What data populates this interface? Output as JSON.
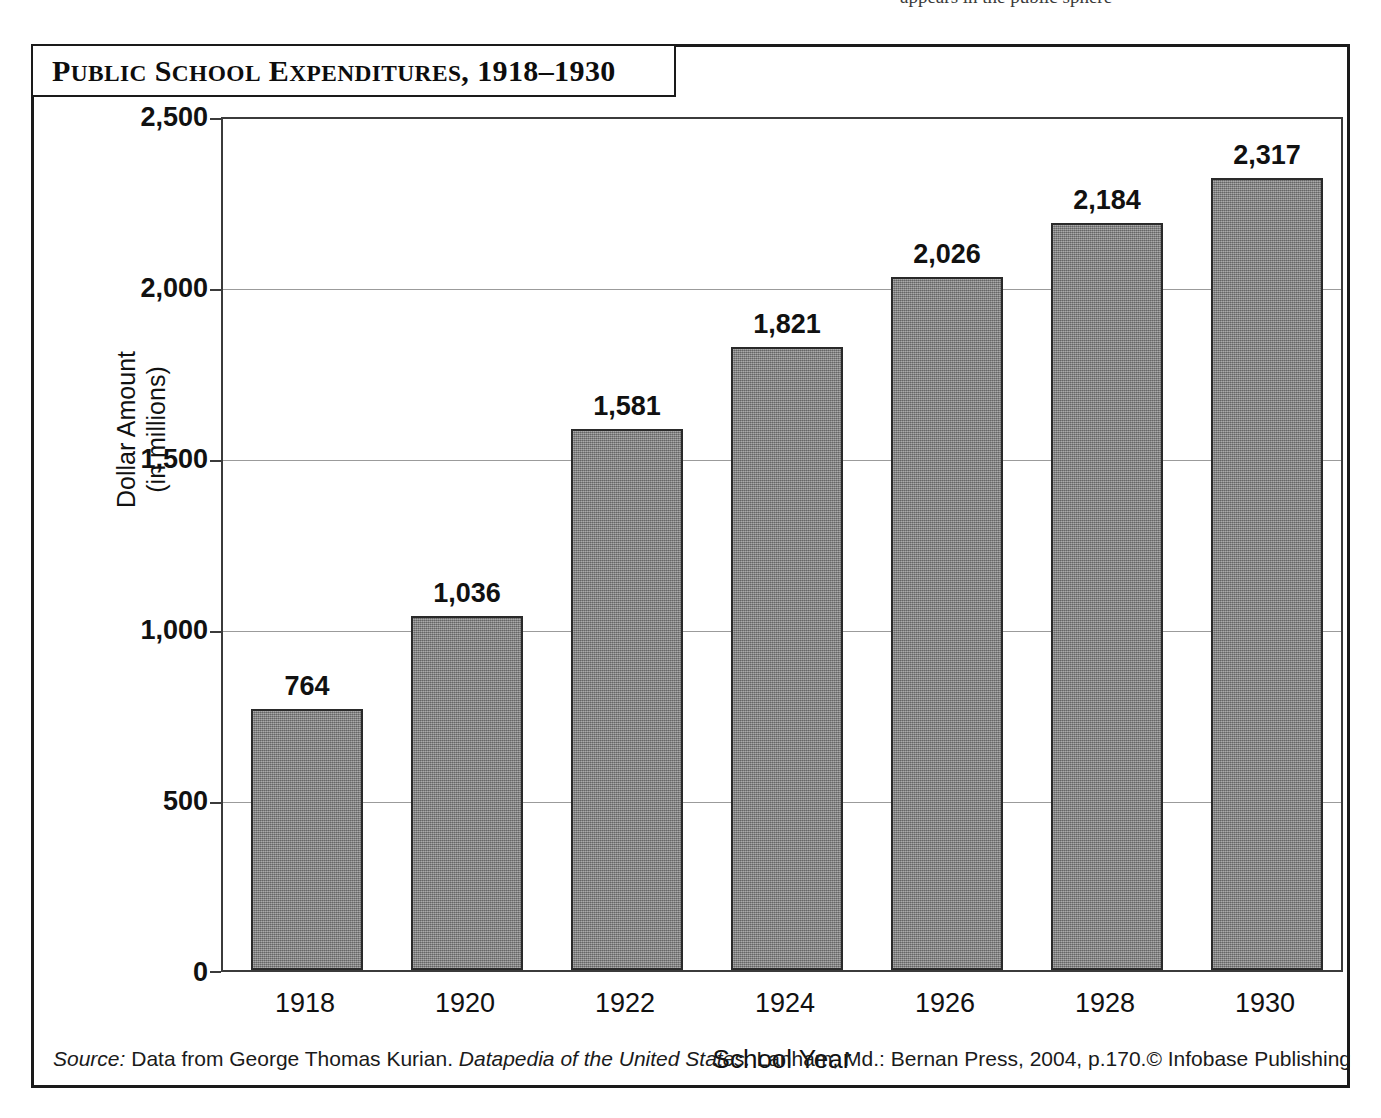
{
  "page_bleed_text": "appears in the public sphere",
  "chart_title": "Public School Expenditures, 1918–1930",
  "axes": {
    "y_title_line1": "Dollar Amount",
    "y_title_line2": "(in millions)",
    "x_title": "School Year",
    "y_ticks": [
      "2,500",
      "2,000",
      "1,500",
      "1,000",
      "500",
      "0"
    ],
    "x_ticks": [
      "1918",
      "1920",
      "1922",
      "1924",
      "1926",
      "1928",
      "1930"
    ]
  },
  "bar_labels": [
    "764",
    "1,036",
    "1,581",
    "1,821",
    "2,026",
    "2,184",
    "2,317"
  ],
  "footer": {
    "source_label": "Source:",
    "source_text_1": " Data from George Thomas Kurian. ",
    "source_work": "Datapedia of the United States.",
    "source_text_2": " Lanham, Md.: Bernan Press, 2004, p.170.",
    "copyright": "© Infobase Publishing"
  },
  "colors": {
    "bar_fill": "#8a8a8a",
    "bar_stroke": "#2a2a2a",
    "frame": "#1a1a1a",
    "gridline": "#9b9b9b",
    "text": "#111111"
  },
  "chart_data": {
    "type": "bar",
    "title": "Public School Expenditures, 1918–1930",
    "xlabel": "School Year",
    "ylabel": "Dollar Amount (in millions)",
    "categories": [
      "1918",
      "1920",
      "1922",
      "1924",
      "1926",
      "1928",
      "1930"
    ],
    "values": [
      764,
      1036,
      1581,
      1821,
      2026,
      2184,
      2317
    ],
    "data_labels": [
      "764",
      "1,036",
      "1,581",
      "1,821",
      "2,026",
      "2,184",
      "2,317"
    ],
    "ylim": [
      0,
      2500
    ],
    "ytick_values": [
      0,
      500,
      1000,
      1500,
      2000,
      2500
    ],
    "grid": "horizontal-major-only",
    "legend": "none",
    "units": "millions of dollars",
    "source": "Data from George Thomas Kurian. Datapedia of the United States. Lanham, Md.: Bernan Press, 2004, p.170."
  }
}
